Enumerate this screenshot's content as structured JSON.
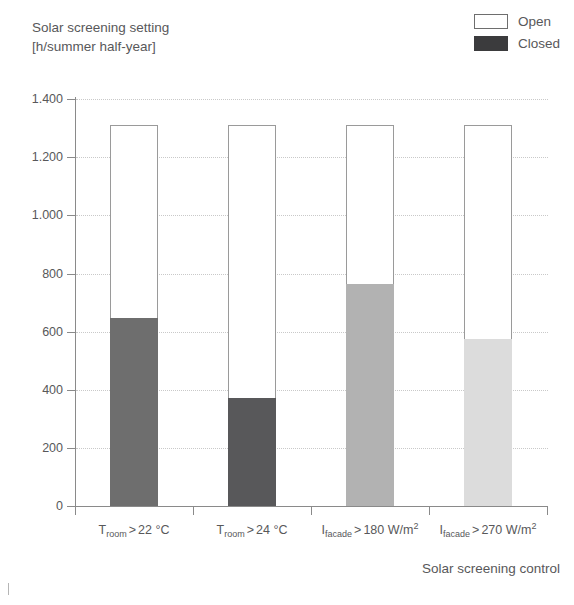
{
  "chart_data": {
    "type": "bar",
    "subtype": "stacked",
    "title": "",
    "ylabel": "Solar screening setting\n[h/summer half-year]",
    "xlabel": "Solar screening control",
    "ylim": [
      0,
      1400
    ],
    "yticks": [
      0,
      200,
      400,
      600,
      800,
      1000,
      1200,
      1400
    ],
    "ytick_labels": [
      "0",
      "200",
      "400",
      "600",
      "800",
      "1.000",
      "1.200",
      "1.400"
    ],
    "grid": true,
    "legend_position": "top-right",
    "legend": [
      "Open",
      "Closed"
    ],
    "total_height": 1310,
    "categories": [
      "T_room > 22 °C",
      "T_room > 24 °C",
      "I_facade > 180 W/m²",
      "I_facade > 270 W/m²"
    ],
    "series": [
      {
        "name": "Closed",
        "values": [
          645,
          370,
          765,
          575
        ]
      },
      {
        "name": "Open",
        "values": [
          665,
          940,
          545,
          735
        ]
      }
    ],
    "bar_colors": [
      "#6e6e6e",
      "#58585a",
      "#b2b2b2",
      "#dcdcdc"
    ]
  },
  "axis_titles": {
    "y": "Solar screening setting\n[h/summer half-year]",
    "x": "Solar screening control"
  },
  "legend": {
    "items": [
      {
        "label": "Open",
        "swatch": "open"
      },
      {
        "label": "Closed",
        "swatch": "closed"
      }
    ]
  },
  "y_axis": {
    "labels": [
      "1.400",
      "1.200",
      "1.000",
      "800",
      "600",
      "400",
      "200",
      "0"
    ]
  },
  "x_axis": {
    "labels": [
      {
        "symbol": "T",
        "sub": "room",
        "op": ">",
        "value": "22 °C",
        "sup": ""
      },
      {
        "symbol": "T",
        "sub": "room",
        "op": ">",
        "value": "24 °C",
        "sup": ""
      },
      {
        "symbol": "I",
        "sub": "facade",
        "op": ">",
        "value": "180 W/m",
        "sup": "2"
      },
      {
        "symbol": "I",
        "sub": "facade",
        "op": ">",
        "value": "270 W/m",
        "sup": "2"
      }
    ]
  }
}
